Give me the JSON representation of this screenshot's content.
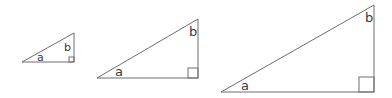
{
  "diagram": {
    "stroke_color": "#6e6e6e",
    "label_color": "#3a3a3a",
    "triangles": [
      {
        "name": "small",
        "points": [
          [
            22,
            62
          ],
          [
            74,
            62
          ],
          [
            74,
            33
          ]
        ],
        "right_angle_box": {
          "x": 69,
          "y": 57,
          "size": 5
        },
        "label_a": {
          "text": "a",
          "x": 37,
          "y": 61,
          "size": 11
        },
        "label_b": {
          "text": "b",
          "x": 64,
          "y": 51,
          "size": 11
        }
      },
      {
        "name": "medium",
        "points": [
          [
            97,
            78
          ],
          [
            198,
            78
          ],
          [
            198,
            19
          ]
        ],
        "right_angle_box": {
          "x": 188,
          "y": 68,
          "size": 10
        },
        "label_a": {
          "text": "a",
          "x": 115,
          "y": 76,
          "size": 13
        },
        "label_b": {
          "text": "b",
          "x": 189,
          "y": 36,
          "size": 13
        }
      },
      {
        "name": "large",
        "points": [
          [
            221,
            92
          ],
          [
            374,
            92
          ],
          [
            374,
            5
          ]
        ],
        "right_angle_box": {
          "x": 359,
          "y": 77,
          "size": 15
        },
        "label_a": {
          "text": "a",
          "x": 241,
          "y": 90,
          "size": 13
        },
        "label_b": {
          "text": "b",
          "x": 365,
          "y": 22,
          "size": 13
        }
      }
    ]
  }
}
